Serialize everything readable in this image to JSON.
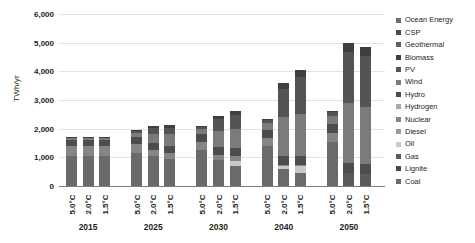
{
  "chart_data": {
    "type": "bar",
    "subtype": "stacked-bar-grouped",
    "title": "",
    "xlabel": "",
    "ylabel": "TWh/yr",
    "ylim": [
      0,
      6000
    ],
    "yticks": [
      0,
      1000,
      2000,
      3000,
      4000,
      5000,
      6000
    ],
    "ytick_labels": [
      "0",
      "1,000",
      "2,000",
      "3,000",
      "4,000",
      "5,000",
      "6,000"
    ],
    "grid": true,
    "legend_position": "right",
    "groups": [
      "2015",
      "2025",
      "2030",
      "2040",
      "2050"
    ],
    "scenarios": [
      "5.0°C",
      "2.0°C",
      "1.5°C"
    ],
    "categories": [
      "Ocean Energy",
      "CSP",
      "Geothermal",
      "Biomass",
      "PV",
      "Wind",
      "Hydro",
      "Hydrogen",
      "Nuclear",
      "Diesel",
      "Oil",
      "Gas",
      "Lignite",
      "Coal"
    ],
    "stack_order_bottom_to_top": [
      "Coal",
      "Lignite",
      "Gas",
      "Oil",
      "Diesel",
      "Nuclear",
      "Hydrogen",
      "Hydro",
      "Wind",
      "PV",
      "Biomass",
      "Geothermal",
      "CSP",
      "Ocean Energy"
    ],
    "colors": {
      "Ocean Energy": "#6e6e6e",
      "CSP": "#4a4a4a",
      "Geothermal": "#5f5f5f",
      "Biomass": "#3f3f3f",
      "PV": "#545454",
      "Wind": "#7b7b7b",
      "Hydro": "#4d4d4d",
      "Hydrogen": "#a8a8a8",
      "Nuclear": "#858585",
      "Diesel": "#9b9b9b",
      "Oil": "#c8c8c8",
      "Gas": "#5a5a5a",
      "Lignite": "#474747",
      "Coal": "#6a6a6a"
    },
    "bars": [
      {
        "group": "2015",
        "scenario": "5.0°C",
        "total": 1720,
        "values": {
          "Coal": 1030,
          "Lignite": 0,
          "Gas": 0,
          "Oil": 0,
          "Diesel": 0,
          "Nuclear": 370,
          "Hydrogen": 0,
          "Hydro": 210,
          "Wind": 60,
          "PV": 20,
          "Biomass": 30,
          "Geothermal": 0,
          "CSP": 0,
          "Ocean Energy": 0
        }
      },
      {
        "group": "2015",
        "scenario": "2.0°C",
        "total": 1720,
        "values": {
          "Coal": 1030,
          "Lignite": 0,
          "Gas": 0,
          "Oil": 0,
          "Diesel": 0,
          "Nuclear": 370,
          "Hydrogen": 0,
          "Hydro": 210,
          "Wind": 60,
          "PV": 20,
          "Biomass": 30,
          "Geothermal": 0,
          "CSP": 0,
          "Ocean Energy": 0
        }
      },
      {
        "group": "2015",
        "scenario": "1.5°C",
        "total": 1720,
        "values": {
          "Coal": 1030,
          "Lignite": 0,
          "Gas": 0,
          "Oil": 0,
          "Diesel": 0,
          "Nuclear": 370,
          "Hydrogen": 0,
          "Hydro": 210,
          "Wind": 60,
          "PV": 20,
          "Biomass": 30,
          "Geothermal": 0,
          "CSP": 0,
          "Ocean Energy": 0
        }
      },
      {
        "group": "2025",
        "scenario": "5.0°C",
        "total": 1960,
        "values": {
          "Coal": 1140,
          "Lignite": 0,
          "Gas": 0,
          "Oil": 0,
          "Diesel": 0,
          "Nuclear": 330,
          "Hydrogen": 0,
          "Hydro": 230,
          "Wind": 150,
          "PV": 70,
          "Biomass": 40,
          "Geothermal": 0,
          "CSP": 0,
          "Ocean Energy": 0
        }
      },
      {
        "group": "2025",
        "scenario": "2.0°C",
        "total": 2090,
        "values": {
          "Coal": 1040,
          "Lignite": 0,
          "Gas": 0,
          "Oil": 0,
          "Diesel": 0,
          "Nuclear": 210,
          "Hydrogen": 0,
          "Hydro": 250,
          "Wind": 330,
          "PV": 190,
          "Biomass": 70,
          "Geothermal": 0,
          "CSP": 0,
          "Ocean Energy": 0
        }
      },
      {
        "group": "2025",
        "scenario": "1.5°C",
        "total": 2120,
        "values": {
          "Coal": 940,
          "Lignite": 0,
          "Gas": 0,
          "Oil": 0,
          "Diesel": 0,
          "Nuclear": 210,
          "Hydrogen": 0,
          "Hydro": 250,
          "Wind": 400,
          "PV": 240,
          "Biomass": 80,
          "Geothermal": 0,
          "CSP": 0,
          "Ocean Energy": 0
        }
      },
      {
        "group": "2030",
        "scenario": "5.0°C",
        "total": 2090,
        "values": {
          "Coal": 1250,
          "Lignite": 0,
          "Gas": 0,
          "Oil": 0,
          "Diesel": 0,
          "Nuclear": 300,
          "Hydrogen": 0,
          "Hydro": 250,
          "Wind": 180,
          "PV": 80,
          "Biomass": 30,
          "Geothermal": 0,
          "CSP": 0,
          "Ocean Energy": 0
        }
      },
      {
        "group": "2030",
        "scenario": "2.0°C",
        "total": 2430,
        "values": {
          "Coal": 900,
          "Lignite": 0,
          "Gas": 0,
          "Oil": 0,
          "Diesel": 0,
          "Nuclear": 180,
          "Hydrogen": 0,
          "Hydro": 280,
          "Wind": 570,
          "PV": 400,
          "Biomass": 100,
          "Geothermal": 0,
          "CSP": 0,
          "Ocean Energy": 0
        }
      },
      {
        "group": "2030",
        "scenario": "1.5°C",
        "total": 2610,
        "values": {
          "Coal": 700,
          "Lignite": 0,
          "Gas": 0,
          "Oil": 190,
          "Diesel": 0,
          "Nuclear": 160,
          "Hydrogen": 0,
          "Hydro": 290,
          "Wind": 660,
          "PV": 480,
          "Biomass": 130,
          "Geothermal": 0,
          "CSP": 0,
          "Ocean Energy": 0
        }
      },
      {
        "group": "2040",
        "scenario": "5.0°C",
        "total": 2350,
        "values": {
          "Coal": 1380,
          "Lignite": 0,
          "Gas": 0,
          "Oil": 0,
          "Diesel": 0,
          "Nuclear": 300,
          "Hydrogen": 0,
          "Hydro": 280,
          "Wind": 240,
          "PV": 120,
          "Biomass": 30,
          "Geothermal": 0,
          "CSP": 0,
          "Ocean Energy": 0
        }
      },
      {
        "group": "2040",
        "scenario": "2.0°C",
        "total": 3590,
        "values": {
          "Coal": 580,
          "Lignite": 0,
          "Gas": 0,
          "Oil": 110,
          "Diesel": 0,
          "Nuclear": 30,
          "Hydrogen": 0,
          "Hydro": 320,
          "Wind": 1360,
          "PV": 990,
          "Biomass": 200,
          "Geothermal": 0,
          "CSP": 0,
          "Ocean Energy": 0
        }
      },
      {
        "group": "2040",
        "scenario": "1.5°C",
        "total": 4050,
        "values": {
          "Coal": 450,
          "Lignite": 0,
          "Gas": 0,
          "Oil": 250,
          "Diesel": 0,
          "Nuclear": 20,
          "Hydrogen": 0,
          "Hydro": 330,
          "Wind": 1470,
          "PV": 1270,
          "Biomass": 260,
          "Geothermal": 0,
          "CSP": 0,
          "Ocean Energy": 0
        }
      },
      {
        "group": "2050",
        "scenario": "5.0°C",
        "total": 2630,
        "values": {
          "Coal": 1550,
          "Lignite": 0,
          "Gas": 0,
          "Oil": 0,
          "Diesel": 0,
          "Nuclear": 300,
          "Hydrogen": 0,
          "Hydro": 300,
          "Wind": 290,
          "PV": 150,
          "Biomass": 40,
          "Geothermal": 0,
          "CSP": 0,
          "Ocean Energy": 0
        }
      },
      {
        "group": "2050",
        "scenario": "2.0°C",
        "total": 4990,
        "values": {
          "Coal": 0,
          "Lignite": 0,
          "Gas": 460,
          "Oil": 0,
          "Diesel": 0,
          "Nuclear": 0,
          "Hydrogen": 0,
          "Hydro": 350,
          "Wind": 2080,
          "PV": 1780,
          "Biomass": 320,
          "Geothermal": 0,
          "CSP": 0,
          "Ocean Energy": 0
        }
      },
      {
        "group": "2050",
        "scenario": "1.5°C",
        "total": 4850,
        "values": {
          "Coal": 0,
          "Lignite": 0,
          "Gas": 430,
          "Oil": 0,
          "Diesel": 0,
          "Nuclear": 0,
          "Hydrogen": 0,
          "Hydro": 350,
          "Wind": 1980,
          "PV": 1770,
          "Biomass": 320,
          "Geothermal": 0,
          "CSP": 0,
          "Ocean Energy": 0
        }
      }
    ]
  }
}
